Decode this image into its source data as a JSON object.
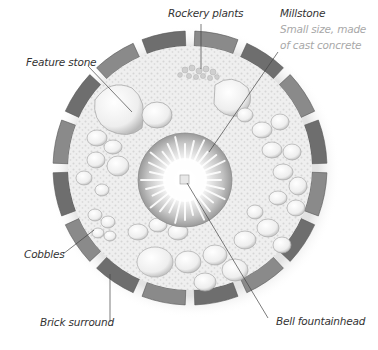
{
  "diagram": {
    "type": "garden-feature-plan",
    "labels": {
      "rockery_plants": "Rockery plants",
      "millstone_title": "Millstone",
      "millstone_desc_1": "Small size, made",
      "millstone_desc_2": "of cast concrete",
      "feature_stone": "Feature stone",
      "cobbles": "Cobbles",
      "brick_surround": "Brick surround",
      "bell_fountainhead": "Bell fountainhead"
    },
    "colors": {
      "brick": "#6e6e6e",
      "brick_light": "#8a8a8a",
      "gravel": "#ececec",
      "stone": "#f4f4f4",
      "stone_edge": "#b5b5b5",
      "millstone_dark": "#9a9a9a",
      "leader_line": "#444444",
      "label_text": "#333333",
      "label_sub_text": "#a8a8a8"
    },
    "geometry": {
      "center_x": 190,
      "center_y": 168,
      "outer_radius": 137,
      "inner_radius": 122,
      "millstone_radius": 47,
      "brick_count": 16
    }
  }
}
